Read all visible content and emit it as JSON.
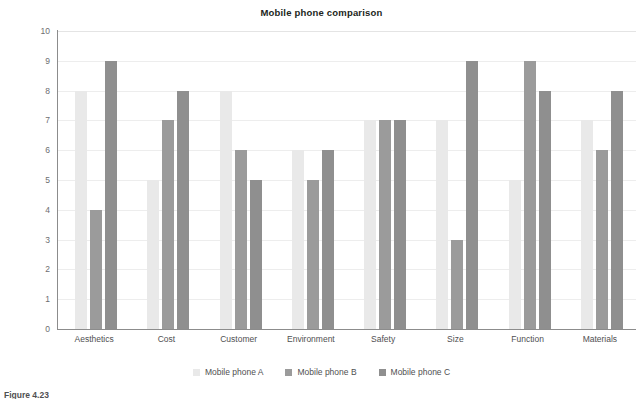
{
  "chart_data": {
    "type": "bar",
    "title": "Mobile phone comparison",
    "xlabel": "",
    "ylabel": "",
    "ylim": [
      0,
      10
    ],
    "ytick_labels": [
      "10",
      "9",
      "8",
      "7",
      "6",
      "5",
      "4",
      "3",
      "2",
      "1",
      "0"
    ],
    "grid": true,
    "legend_position": "bottom",
    "categories": [
      "Aesthetics",
      "Cost",
      "Customer",
      "Environment",
      "Safety",
      "Size",
      "Function",
      "Materials"
    ],
    "series": [
      {
        "name": "Mobile phone A",
        "color": "#e9e9e9",
        "values": [
          8,
          5,
          8,
          6,
          7,
          7,
          5,
          7
        ]
      },
      {
        "name": "Mobile phone B",
        "color": "#9b9b9b",
        "values": [
          4,
          7,
          6,
          5,
          7,
          3,
          9,
          6
        ]
      },
      {
        "name": "Mobile phone C",
        "color": "#8f8f8f",
        "values": [
          9,
          8,
          5,
          6,
          7,
          9,
          8,
          8
        ]
      }
    ]
  },
  "caption": {
    "label": "Figure",
    "number": "4.23",
    "text": ""
  },
  "colors": {
    "series_a": "#e9e9e9",
    "series_b": "#9b9b9b",
    "series_c": "#8f8f8f",
    "axis": "#8c8c8c",
    "grid": "#ededed",
    "text": "#4f4f51",
    "tick_text": "#6d6e70",
    "title_text": "#221f20",
    "background": "#ffffff"
  }
}
